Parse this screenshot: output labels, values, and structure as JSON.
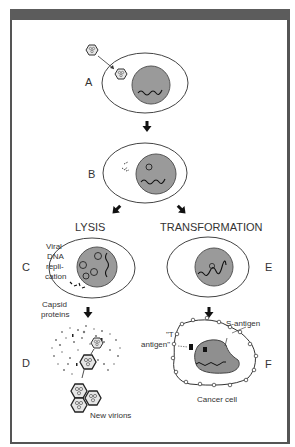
{
  "figure": {
    "stages": {
      "A": "A",
      "B": "B",
      "C": "C",
      "D": "D",
      "E": "E",
      "F": "F"
    },
    "branches": {
      "left": "LYSIS",
      "right": "TRANSFORMATION"
    },
    "annotations": {
      "viral_dna_1": "Viral",
      "viral_dna_2": "DNA",
      "viral_dna_3": "repli-",
      "viral_dna_4": "cation",
      "capsid_1": "Capsid",
      "capsid_2": "proteins",
      "new_virions": "New virions",
      "t_antigen_1": "\"T",
      "t_antigen_2": "antigen\"",
      "s_antigen": "S-antigen",
      "cancer_cell": "Cancer cell"
    },
    "colors": {
      "frame": "#555555",
      "topbar": "#5c5c5c",
      "nucleus": "#9a9a9a",
      "outline": "#333333"
    }
  }
}
